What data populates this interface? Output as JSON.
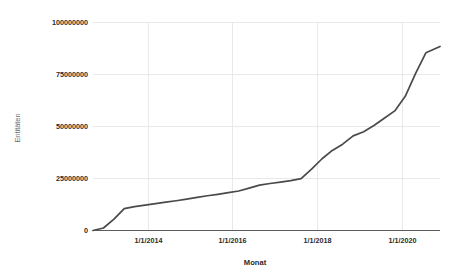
{
  "chart_data": {
    "type": "line",
    "title": "",
    "xlabel": "Monat",
    "ylabel": "Entitäten",
    "grid": true,
    "legend": false,
    "legend_position": "none",
    "line_color": "#4a4a4a",
    "gridline_color": "#e3e3e3",
    "axis_color": "#5c5c5c",
    "background_color": "#ffffff",
    "xlim": [
      "2012-07-01",
      "2020-11-01"
    ],
    "ylim": [
      0,
      100000000
    ],
    "y_ticks": [
      0,
      25000000,
      50000000,
      75000000,
      100000000
    ],
    "y_tick_labels": [
      "0",
      "25000000",
      "50000000",
      "75000000",
      "100000000"
    ],
    "x_ticks": [
      "1/1/2014",
      "1/1/2016",
      "1/1/2018",
      "1/1/2020"
    ],
    "x_tick_labels": [
      "1/1/2014",
      "1/1/2016",
      "1/1/2018",
      "1/1/2020"
    ],
    "series": [
      {
        "name": "Entitäten",
        "x": [
          "2012-07-01",
          "2012-10-01",
          "2013-01-01",
          "2013-04-01",
          "2013-07-01",
          "2013-10-01",
          "2014-01-01",
          "2014-04-01",
          "2014-07-01",
          "2014-10-01",
          "2015-01-01",
          "2015-04-01",
          "2015-07-01",
          "2015-10-01",
          "2016-01-01",
          "2016-04-01",
          "2016-07-01",
          "2016-10-01",
          "2017-01-01",
          "2017-04-01",
          "2017-07-01",
          "2017-10-01",
          "2018-01-01",
          "2018-04-01",
          "2018-07-01",
          "2018-10-01",
          "2019-01-01",
          "2019-04-01",
          "2019-07-01",
          "2019-10-01",
          "2020-01-01",
          "2020-04-01",
          "2020-07-01",
          "2020-11-01"
        ],
        "y": [
          0,
          1200000,
          5500000,
          10500000,
          11500000,
          12200000,
          12900000,
          13600000,
          14300000,
          15100000,
          15900000,
          16700000,
          17400000,
          18200000,
          19000000,
          20400000,
          21800000,
          22600000,
          23300000,
          24000000,
          24900000,
          29500000,
          34500000,
          38500000,
          41500000,
          45500000,
          47500000,
          50500000,
          54000000,
          57500000,
          64500000,
          75500000,
          85500000,
          88500000
        ]
      }
    ]
  },
  "axes": {
    "y_title": "Entitäten",
    "x_title": "Monat"
  }
}
